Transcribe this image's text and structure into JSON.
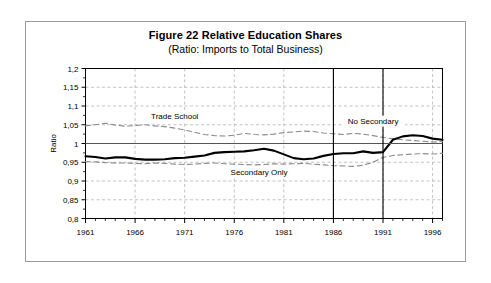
{
  "figure": {
    "title": "Figure 22  Relative Education Shares",
    "subtitle": "(Ratio: Imports to Total Business)"
  },
  "chart_data": {
    "type": "line",
    "title": "Figure 22  Relative Education Shares",
    "subtitle": "(Ratio: Imports to Total Business)",
    "xlabel": "",
    "ylabel": "Ratio",
    "xlim": [
      1961,
      1997
    ],
    "ylim": [
      0.8,
      1.2
    ],
    "ytick_labels": [
      "1,2",
      "1,15",
      "1,1",
      "1,05",
      "1",
      "0,95",
      "0,9",
      "0,85",
      "0,8"
    ],
    "ytick_values": [
      1.2,
      1.15,
      1.1,
      1.05,
      1.0,
      0.95,
      0.9,
      0.85,
      0.8
    ],
    "xtick_labels": [
      "1961",
      "1966",
      "1971",
      "1976",
      "1981",
      "1986",
      "1991",
      "1996"
    ],
    "xtick_values": [
      1961,
      1966,
      1971,
      1976,
      1981,
      1986,
      1991,
      1996
    ],
    "x_minor_tick_step": 1,
    "grid": "horizontal-and-vertical-dashed",
    "legend_position": "inline-annotations",
    "reference_lines": {
      "horizontal": [
        1.0
      ],
      "vertical": [
        1986,
        1991
      ]
    },
    "x": [
      1961,
      1962,
      1963,
      1964,
      1965,
      1966,
      1967,
      1968,
      1969,
      1970,
      1971,
      1972,
      1973,
      1974,
      1975,
      1976,
      1977,
      1978,
      1979,
      1980,
      1981,
      1982,
      1983,
      1984,
      1985,
      1986,
      1987,
      1988,
      1989,
      1990,
      1991,
      1992,
      1993,
      1994,
      1995,
      1996,
      1997
    ],
    "series": [
      {
        "name": "Secondary Only",
        "style": "solid-thick-black",
        "color": "#000000",
        "label_x": 1978.5,
        "label_y": 0.915,
        "values": [
          0.966,
          0.964,
          0.96,
          0.963,
          0.963,
          0.959,
          0.957,
          0.957,
          0.958,
          0.961,
          0.962,
          0.965,
          0.968,
          0.975,
          0.977,
          0.978,
          0.979,
          0.982,
          0.986,
          0.981,
          0.971,
          0.961,
          0.958,
          0.96,
          0.967,
          0.972,
          0.974,
          0.974,
          0.979,
          0.975,
          0.977,
          1.01,
          1.019,
          1.022,
          1.02,
          1.013,
          1.01
        ]
      },
      {
        "name": "Trade School",
        "style": "dashed-gray",
        "color": "#8a8a8a",
        "label_x": 1970.0,
        "label_y": 1.066,
        "values": [
          1.047,
          1.05,
          1.054,
          1.049,
          1.046,
          1.048,
          1.05,
          1.047,
          1.045,
          1.041,
          1.036,
          1.03,
          1.024,
          1.021,
          1.02,
          1.022,
          1.027,
          1.024,
          1.023,
          1.025,
          1.029,
          1.031,
          1.033,
          1.032,
          1.028,
          1.026,
          1.024,
          1.027,
          1.025,
          1.021,
          1.016,
          1.013,
          1.01,
          1.008,
          1.006,
          1.004,
          1.005
        ]
      },
      {
        "name": "No Secondary",
        "style": "dashed-gray",
        "color": "#8a8a8a",
        "label_x": 1990.0,
        "label_y": 1.053,
        "values": [
          0.952,
          0.951,
          0.949,
          0.948,
          0.948,
          0.947,
          0.946,
          0.948,
          0.947,
          0.945,
          0.944,
          0.945,
          0.947,
          0.948,
          0.946,
          0.945,
          0.944,
          0.943,
          0.944,
          0.946,
          0.945,
          0.946,
          0.947,
          0.945,
          0.943,
          0.941,
          0.94,
          0.939,
          0.942,
          0.95,
          0.963,
          0.968,
          0.97,
          0.972,
          0.973,
          0.972,
          0.974
        ]
      }
    ]
  }
}
